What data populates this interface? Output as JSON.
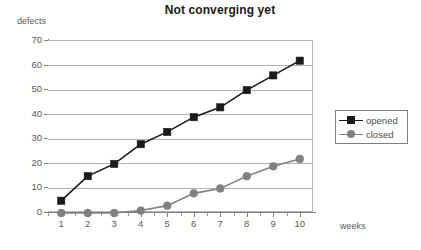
{
  "chart_data": {
    "type": "line",
    "title": "Not converging yet",
    "xlabel": "weeks",
    "ylabel": "defects",
    "x": [
      1,
      2,
      3,
      4,
      5,
      6,
      7,
      8,
      9,
      10
    ],
    "xtick_labels": [
      "1",
      "2",
      "3",
      "4",
      "5",
      "6",
      "7",
      "8",
      "9",
      "10"
    ],
    "ytick_labels": [
      "0",
      "10",
      "20",
      "30",
      "40",
      "50",
      "60",
      "70"
    ],
    "yticks": [
      0,
      10,
      20,
      30,
      40,
      50,
      60,
      70
    ],
    "ylim": [
      0,
      70
    ],
    "xlim": [
      0.5,
      10.5
    ],
    "grid": "horizontal",
    "legend_position": "right",
    "series": [
      {
        "name": "opened",
        "values": [
          5,
          15,
          20,
          28,
          33,
          39,
          43,
          50,
          56,
          62
        ],
        "color": "#1a1a1a",
        "marker": "square"
      },
      {
        "name": "closed",
        "values": [
          0,
          0,
          0,
          1,
          3,
          8,
          10,
          15,
          19,
          22
        ],
        "color": "#808080",
        "marker": "circle"
      }
    ],
    "colors": {
      "background": "#ffffff",
      "gridline": "#b3b3b3",
      "axis": "#808080",
      "text": "#595959",
      "title": "#1a1a1a",
      "opened": "#1a1a1a",
      "closed": "#808080"
    }
  }
}
